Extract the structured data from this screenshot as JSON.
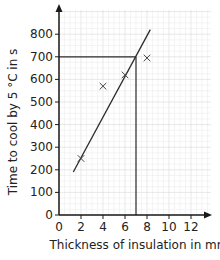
{
  "chart_data": {
    "type": "scatter",
    "title": "",
    "xlabel": "Thickness of insulation in mm",
    "ylabel": "Time to cool by 5 °C in s",
    "xlim": [
      0,
      13.8
    ],
    "ylim": [
      0,
      900
    ],
    "x_ticks": [
      0,
      2,
      4,
      6,
      8,
      10,
      12
    ],
    "y_ticks": [
      0,
      100,
      200,
      300,
      400,
      500,
      600,
      700,
      800
    ],
    "grid": true,
    "series": [
      {
        "name": "measurements",
        "marker": "x",
        "points": [
          {
            "x": 2,
            "y": 250
          },
          {
            "x": 4,
            "y": 570
          },
          {
            "x": 6,
            "y": 620
          },
          {
            "x": 8,
            "y": 695
          }
        ]
      }
    ],
    "best_fit_line": {
      "from": {
        "x": 1.3,
        "y": 190
      },
      "to": {
        "x": 8.3,
        "y": 820
      }
    },
    "reading_lines": {
      "horizontal_y": 700,
      "vertical_x": 7
    }
  },
  "axes": {
    "x_label": "Thickness of insulation in mm",
    "y_label": "Time to cool by 5 °C in s"
  },
  "colors": {
    "axis": "#1a1a1a",
    "grid_minor": "#ececec",
    "grid_major": "#d9d9d9",
    "line": "#2b2b2b",
    "marker": "#444444"
  }
}
